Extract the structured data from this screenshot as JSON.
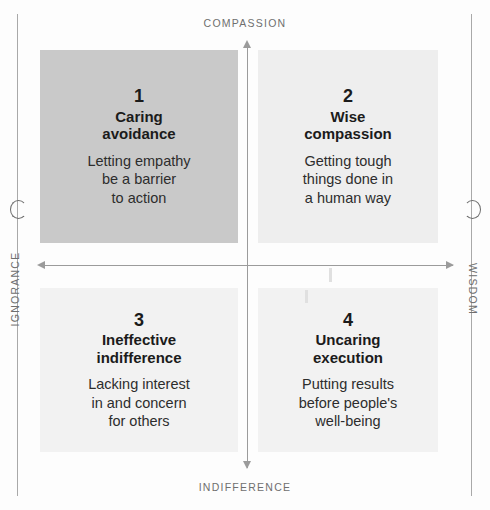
{
  "figure": {
    "type": "2x2-matrix",
    "axes": {
      "top_label": "COMPASSION",
      "bottom_label": "INDIFFERENCE",
      "left_label": "IGNORANCE",
      "right_label": "WISDOM"
    },
    "quadrants": [
      {
        "number": "1",
        "title": "Caring\navoidance",
        "title_line1": "Caring",
        "title_line2": "avoidance",
        "description": "Letting empathy be a barrier to action",
        "desc_line1": "Letting empathy",
        "desc_line2": "be a barrier",
        "desc_line3": "to action",
        "fill": "#c9c9c9",
        "position": "top-left"
      },
      {
        "number": "2",
        "title": "Wise\ncompassion",
        "title_line1": "Wise",
        "title_line2": "compassion",
        "description": "Getting tough things done in a human way",
        "desc_line1": "Getting tough",
        "desc_line2": "things done in",
        "desc_line3": "a human way",
        "fill": "#eeeeee",
        "position": "top-right"
      },
      {
        "number": "3",
        "title": "Ineffective\nindifference",
        "title_line1": "Ineffective",
        "title_line2": "indifference",
        "description": "Lacking interest in and concern for others",
        "desc_line1": "Lacking interest",
        "desc_line2": "in and concern",
        "desc_line3": "for others",
        "fill": "#f2f2f2",
        "position": "bottom-left"
      },
      {
        "number": "4",
        "title": "Uncaring\nexecution",
        "title_line1": "Uncaring",
        "title_line2": "execution",
        "description": "Putting results before people's well-being",
        "desc_line1": "Putting results",
        "desc_line2": "before people's",
        "desc_line3": "well-being",
        "fill": "#f2f2f2",
        "position": "bottom-right"
      }
    ]
  },
  "chart_data": {
    "type": "table",
    "title": "",
    "xlabel": "IGNORANCE — WISDOM",
    "ylabel": "INDIFFERENCE — COMPASSION",
    "categories": [
      "1 Caring avoidance",
      "2 Wise compassion",
      "3 Ineffective indifference",
      "4 Uncaring execution"
    ],
    "series": [
      {
        "name": "quadrant placement",
        "points": [
          {
            "label": "1 Caring avoidance",
            "x": "low wisdom",
            "y": "high compassion"
          },
          {
            "label": "2 Wise compassion",
            "x": "high wisdom",
            "y": "high compassion"
          },
          {
            "label": "3 Ineffective indifference",
            "x": "low wisdom",
            "y": "low compassion"
          },
          {
            "label": "4 Uncaring execution",
            "x": "high wisdom",
            "y": "low compassion"
          }
        ]
      }
    ],
    "axis_endpoints": {
      "x_left": "IGNORANCE",
      "x_right": "WISDOM",
      "y_top": "COMPASSION",
      "y_bottom": "INDIFFERENCE"
    },
    "grid": false,
    "legend": "none"
  }
}
